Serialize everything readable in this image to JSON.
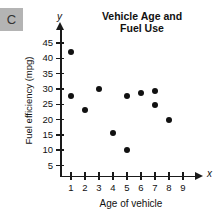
{
  "choice": {
    "label": "C"
  },
  "chart_data": {
    "type": "scatter",
    "title": "Vehicle Age and Fuel Use",
    "title_lines": [
      "Vehicle Age and",
      "Fuel Use"
    ],
    "xlabel": "Age of vehicle",
    "ylabel": "Fuel efficiency (mpg)",
    "x_axis_variable": "x",
    "y_axis_variable": "y",
    "xlim": [
      0,
      9.6
    ],
    "ylim": [
      0,
      47
    ],
    "grid": false,
    "legend": null,
    "xticks": [
      1,
      2,
      3,
      4,
      5,
      6,
      7,
      8,
      9
    ],
    "xtick_labels": [
      "1",
      "2",
      "3",
      "4",
      "5",
      "6",
      "7",
      "8",
      "9"
    ],
    "yticks": [
      5,
      10,
      15,
      20,
      25,
      30,
      35,
      40,
      45
    ],
    "ytick_labels": [
      "5",
      "10",
      "15",
      "20",
      "25",
      "30",
      "35",
      "40",
      "45"
    ],
    "points": [
      {
        "x": 1,
        "y": 42.0
      },
      {
        "x": 1,
        "y": 27.8
      },
      {
        "x": 2,
        "y": 23.2
      },
      {
        "x": 3,
        "y": 29.9
      },
      {
        "x": 4,
        "y": 15.7
      },
      {
        "x": 5,
        "y": 9.9
      },
      {
        "x": 5,
        "y": 27.8
      },
      {
        "x": 6,
        "y": 28.6
      },
      {
        "x": 7,
        "y": 29.4
      },
      {
        "x": 7,
        "y": 24.8
      },
      {
        "x": 8,
        "y": 19.7
      }
    ]
  }
}
